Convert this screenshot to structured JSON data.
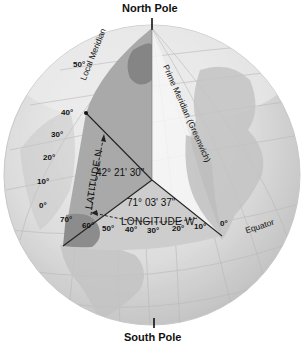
{
  "diagram": {
    "title_top": "North Pole",
    "title_bottom": "South Pole",
    "labels": {
      "local_meridian": "Local Meridian",
      "prime_meridian": "Prime Meridian (Greenwich)",
      "equator": "Equator",
      "latitude_axis": "LATITUDE N",
      "longitude_axis": "LONGITUDE W",
      "latitude_value": "42° 21' 30\"",
      "longitude_value": "71° 03' 37\""
    },
    "latitude_ticks": [
      "50°",
      "40°",
      "30°",
      "20°",
      "10°",
      "0°"
    ],
    "longitude_ticks": [
      "70°",
      "60°",
      "50°",
      "40°",
      "30°",
      "20°",
      "10°",
      "0°"
    ],
    "colors": {
      "globe_light": "#e4e4e4",
      "globe_mid": "#cfcfcf",
      "wedge_dark": "#a9a9a9",
      "land_dark": "#8f8f8f",
      "line": "#222222",
      "text": "#111111"
    }
  }
}
